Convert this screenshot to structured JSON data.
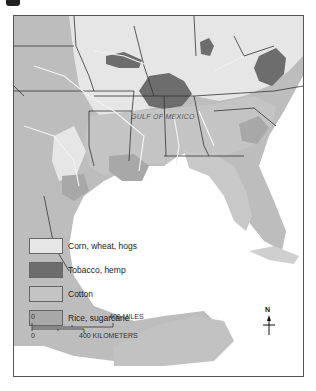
{
  "map": {
    "water_label": "GULF OF MEXICO",
    "colors": {
      "corn_wheat_hogs": "#e6e6e6",
      "tobacco_hemp": "#6d6d6d",
      "cotton": "#c4c4c4",
      "rice_sugarcane": "#a8a8a8",
      "unassigned_land": "#bdbdbd",
      "water": "#ffffff",
      "state_border": "#333333",
      "river": "#f2f2f2"
    }
  },
  "legend": {
    "items": [
      {
        "label": "Corn, wheat, hogs",
        "color": "#e6e6e6"
      },
      {
        "label": "Tobacco, hemp",
        "color": "#6d6d6d"
      },
      {
        "label": "Cotton",
        "color": "#c4c4c4"
      },
      {
        "label": "Rice, sugarcane",
        "color": "#a8a8a8"
      }
    ]
  },
  "scale_bar": {
    "miles_start": "0",
    "miles_end": "400 MILES",
    "km_start": "0",
    "km_end": "400 KILOMETERS"
  },
  "compass": {
    "north_label": "N"
  }
}
